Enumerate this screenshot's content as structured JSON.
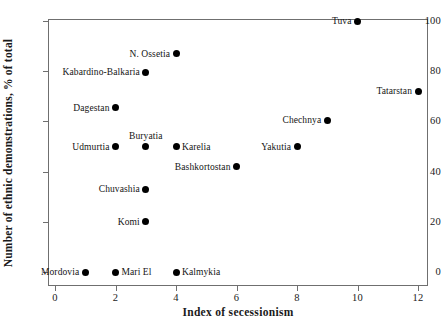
{
  "chart_data": {
    "type": "scatter",
    "title": "",
    "xlabel": "Index of secessionism",
    "ylabel": "Number of ethnic demonstrations, % of total",
    "xlim": [
      0,
      12
    ],
    "ylim": [
      0,
      100
    ],
    "xticks": [
      "0",
      "2",
      "4",
      "6",
      "8",
      "10",
      "12"
    ],
    "xtick_values": [
      0,
      2,
      4,
      6,
      8,
      10,
      12
    ],
    "yticks": [
      "0",
      "20",
      "40",
      "60",
      "80",
      "100"
    ],
    "ytick_values": [
      0,
      20,
      40,
      60,
      80,
      100
    ],
    "grid": false,
    "legend": "none",
    "marker": "filled-circle",
    "marker_color": "#000000",
    "points": [
      {
        "label": "Tuva",
        "x": 10,
        "y": 100,
        "label_pos": "left"
      },
      {
        "label": "N. Ossetia",
        "x": 4,
        "y": 87,
        "label_pos": "left"
      },
      {
        "label": "Kabardino-Balkaria",
        "x": 3,
        "y": 79.5,
        "label_pos": "left"
      },
      {
        "label": "Tatarstan",
        "x": 12,
        "y": 72,
        "label_pos": "left"
      },
      {
        "label": "Dagestan",
        "x": 2,
        "y": 65.5,
        "label_pos": "left"
      },
      {
        "label": "Chechnya",
        "x": 9,
        "y": 60.5,
        "label_pos": "left"
      },
      {
        "label": "Udmurtia",
        "x": 2,
        "y": 50,
        "label_pos": "left"
      },
      {
        "label": "Buryatia",
        "x": 3,
        "y": 50,
        "label_pos": "above"
      },
      {
        "label": "Karelia",
        "x": 4,
        "y": 50,
        "label_pos": "right"
      },
      {
        "label": "Yakutia",
        "x": 8,
        "y": 50,
        "label_pos": "left"
      },
      {
        "label": "Bashkortostan",
        "x": 6,
        "y": 42,
        "label_pos": "left"
      },
      {
        "label": "Chuvashia",
        "x": 3,
        "y": 33,
        "label_pos": "left"
      },
      {
        "label": "Komi",
        "x": 3,
        "y": 20,
        "label_pos": "left"
      },
      {
        "label": "Mordovia",
        "x": 1,
        "y": 0,
        "label_pos": "left"
      },
      {
        "label": "Mari El",
        "x": 2,
        "y": 0,
        "label_pos": "right"
      },
      {
        "label": "Kalmykia",
        "x": 4,
        "y": 0,
        "label_pos": "right"
      }
    ]
  }
}
